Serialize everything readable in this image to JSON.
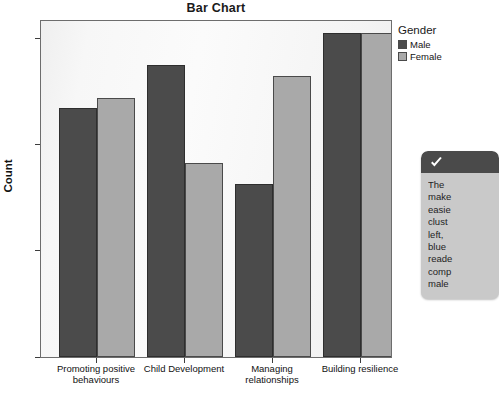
{
  "chart_data": {
    "type": "bar",
    "title": "Bar Chart",
    "xlabel": "",
    "ylabel": "Count",
    "ylim": [
      0,
      30
    ],
    "yticks": [
      0,
      10,
      20,
      30
    ],
    "ytick_labels": [
      "0",
      "10",
      "20",
      "30"
    ],
    "grid": false,
    "legend_position": "right",
    "legend_title": "Gender",
    "categories": [
      "Promoting positive behaviours",
      "Child Development",
      "Managing relationships",
      "Building resilience"
    ],
    "series": [
      {
        "name": "Male",
        "color": "#4b4b4b",
        "values": [
          23,
          27,
          16,
          30
        ]
      },
      {
        "name": "Female",
        "color": "#a9a9a9",
        "values": [
          24,
          18,
          26,
          30
        ]
      }
    ]
  },
  "legend": {
    "title": "Gender",
    "items": [
      {
        "label": "Male"
      },
      {
        "label": "Female"
      }
    ]
  },
  "axis": {
    "y_label": "Count",
    "tick_0": "0",
    "tick_10": "10",
    "tick_20": "20",
    "tick_30": "30"
  },
  "categories_display": {
    "cat0_line1": "Promoting positive",
    "cat0_line2": "behaviours",
    "cat1_line1": "Child Development",
    "cat1_line2": "",
    "cat2_line1": "Managing",
    "cat2_line2": "relationships",
    "cat3_line1": "Building resilience",
    "cat3_line2": ""
  },
  "callout": {
    "icon": "checkmark-icon",
    "lines": [
      "The ",
      "make",
      "easie",
      "clust",
      "left, ",
      "blue ",
      "reade",
      "comp",
      "male"
    ],
    "line0": "The ",
    "line1": "make",
    "line2": "easie",
    "line3": "clust",
    "line4": "left, ",
    "line5": "blue ",
    "line6": "reade",
    "line7": "comp",
    "line8": "male"
  },
  "colors": {
    "male": "#4b4b4b",
    "female": "#a9a9a9",
    "callout_header": "#4a4a4a",
    "callout_body": "#c9c9c9",
    "plot_background": "#f7f7f7"
  }
}
